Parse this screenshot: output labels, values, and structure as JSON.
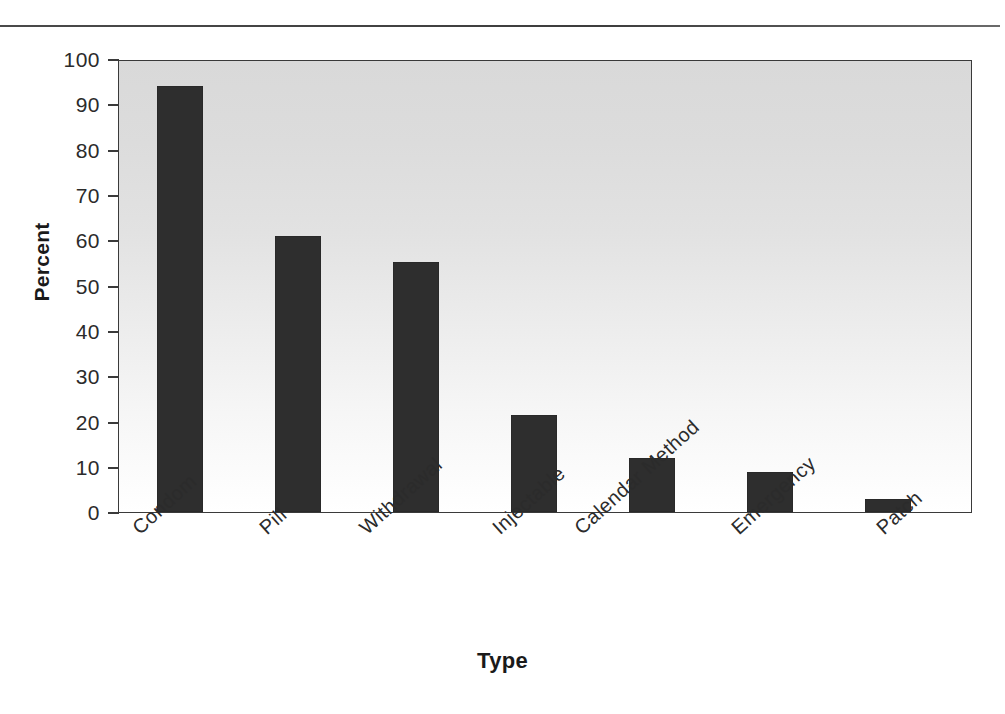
{
  "chart_data": {
    "type": "bar",
    "title": "",
    "xlabel": "Type",
    "ylabel": "Percent",
    "categories": [
      "Condom",
      "Pill",
      "Withdrawal",
      "Injectable",
      "Calendar Method",
      "Emergency",
      "Patch"
    ],
    "values": [
      94.5,
      61.1,
      55.4,
      21.5,
      11.9,
      8.8,
      2.9
    ],
    "ylim": [
      0,
      100
    ],
    "yticks": [
      0,
      10,
      20,
      30,
      40,
      50,
      60,
      70,
      80,
      90,
      100
    ],
    "ytick_labels": [
      "0",
      "10",
      "20",
      "30",
      "40",
      "50",
      "60",
      "70",
      "80",
      "90",
      "100"
    ],
    "grid": false,
    "legend": null,
    "bar_color": "#2e2e2e",
    "plot_background": "#e4e4e4",
    "axis_color": "#3a3a3a"
  },
  "figure": {
    "divider_present": true
  }
}
